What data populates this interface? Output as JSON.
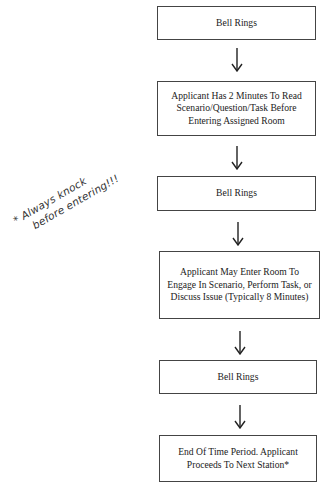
{
  "flowchart": {
    "steps": [
      {
        "label": "Bell Rings"
      },
      {
        "label": "Applicant Has 2 Minutes To Read Scenario/Question/Task Before Entering Assigned Room"
      },
      {
        "label": "Bell Rings"
      },
      {
        "label": "Applicant May Enter Room To Engage In Scenario, Perform Task, or Discuss Issue (Typically 8 Minutes)"
      },
      {
        "label": "Bell Rings"
      },
      {
        "label": "End Of Time Period. Applicant Proceeds To Next Station*"
      }
    ],
    "arrow_icon": "down-arrow-icon"
  },
  "annotation": {
    "line1": "* Always knock",
    "line2": "before entering!!!"
  },
  "colors": {
    "border": "#444444",
    "text": "#222222",
    "background": "#ffffff"
  }
}
